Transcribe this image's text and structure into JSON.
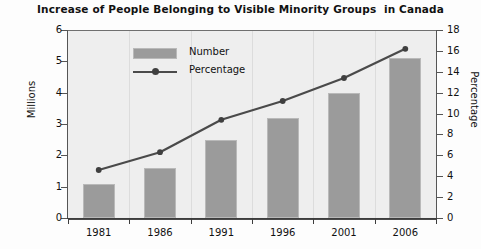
{
  "chart_data": {
    "type": "bar",
    "title": "Increase of People Belonging to Visible Minority Groups  in Canada",
    "categories": [
      "1981",
      "1986",
      "1991",
      "1996",
      "2001",
      "2006"
    ],
    "series": [
      {
        "name": "Number",
        "type": "bar",
        "axis": "left",
        "values": [
          1.1,
          1.6,
          2.5,
          3.2,
          4.0,
          5.1
        ],
        "color": "#9b9b9b"
      },
      {
        "name": "Percentage",
        "type": "line",
        "axis": "right",
        "values": [
          4.6,
          6.3,
          9.4,
          11.2,
          13.4,
          16.2
        ],
        "color": "#4a4a4a"
      }
    ],
    "xlabel": "",
    "ylabel": "Millions",
    "ylabel_right": "Percentage",
    "ylim": [
      0,
      6
    ],
    "ylim_right": [
      0,
      18
    ],
    "yticks": [
      0,
      1,
      2,
      3,
      4,
      5,
      6
    ],
    "yticks_right": [
      0,
      2,
      4,
      6,
      8,
      10,
      12,
      14,
      16,
      18
    ],
    "grid": false,
    "legend_position": "upper-center",
    "plot_background": "#eeeeee"
  },
  "axes": {
    "left_title": "Millions",
    "right_title": "Percentage",
    "left_ticks": [
      "0",
      "1",
      "2",
      "3",
      "4",
      "5",
      "6"
    ],
    "right_ticks": [
      "0",
      "2",
      "4",
      "6",
      "8",
      "10",
      "12",
      "14",
      "16",
      "18"
    ],
    "x_ticks": [
      "1981",
      "1986",
      "1991",
      "1996",
      "2001",
      "2006"
    ]
  },
  "legend": {
    "items": [
      {
        "label": "Number",
        "marker": "bar-swatch"
      },
      {
        "label": "Percentage",
        "marker": "line-dot-swatch"
      }
    ]
  }
}
